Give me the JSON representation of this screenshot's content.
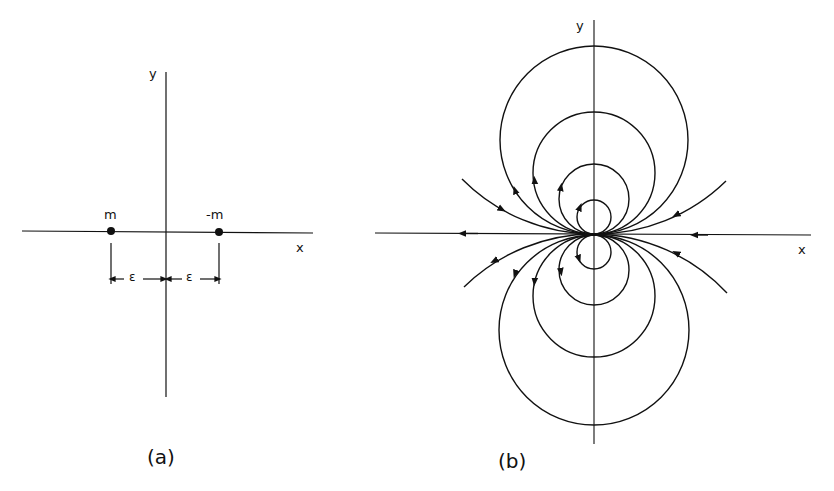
{
  "figure": {
    "panel_a": {
      "caption": "(a)",
      "x_axis_label": "x",
      "y_axis_label": "y",
      "charge_left_label": "m",
      "charge_right_label": "-m",
      "spacing_left_label": "ε",
      "spacing_right_label": "ε"
    },
    "panel_b": {
      "caption": "(b)",
      "x_axis_label": "x",
      "y_axis_label": "y",
      "description": "Dipole field lines: circles tangent to the x-axis at the origin, centered on the y-axis, with arrows indicating flow direction"
    }
  },
  "colors": {
    "ink": "#111111",
    "background": "#ffffff"
  }
}
